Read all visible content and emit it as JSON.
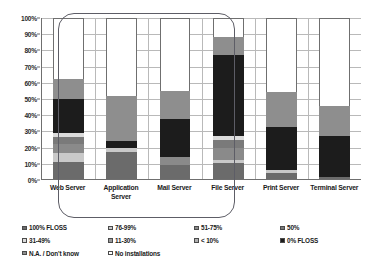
{
  "chart_data": {
    "type": "bar",
    "subtype": "stacked-100-percent",
    "title": "",
    "xlabel": "",
    "ylabel": "",
    "ylim": [
      0,
      100
    ],
    "grid": true,
    "legend_position": "bottom",
    "categories": [
      "Web Server",
      "Application Server",
      "Mail Server",
      "File Server",
      "Print Server",
      "Terminal Server"
    ],
    "y_ticks": [
      "0%",
      "10%",
      "20%",
      "30%",
      "40%",
      "50%",
      "60%",
      "70%",
      "80%",
      "90%",
      "100%"
    ],
    "series": [
      {
        "name": "100% FLOSS",
        "color": "#6b6b6b",
        "values": [
          10.5,
          17.0,
          9.0,
          10.0,
          3.5,
          1.0
        ]
      },
      {
        "name": "76-99%",
        "color": "#c9c9c9",
        "values": [
          5.5,
          2.5,
          0.0,
          2.0,
          2.0,
          0.0
        ]
      },
      {
        "name": "51-75%",
        "color": "#8a8a8a",
        "values": [
          5.5,
          0.0,
          4.5,
          7.0,
          0.0,
          0.0
        ]
      },
      {
        "name": "50%",
        "color": "#7a7a7a",
        "values": [
          4.5,
          0.0,
          0.0,
          5.0,
          0.0,
          0.0
        ]
      },
      {
        "name": "31-49%",
        "color": "#dcdcdc",
        "values": [
          2.5,
          0.0,
          0.0,
          2.5,
          0.0,
          0.0
        ]
      },
      {
        "name": "11-30%",
        "color": "#9a9a9a",
        "values": [
          0.0,
          0.0,
          0.0,
          0.0,
          0.0,
          0.0
        ]
      },
      {
        "name": "< 10%",
        "color": "#b0b0b0",
        "values": [
          0.0,
          0.0,
          0.0,
          0.0,
          0.0,
          0.0
        ]
      },
      {
        "name": "0% FLOSS",
        "color": "#1c1c1c",
        "values": [
          21.5,
          4.0,
          24.0,
          50.5,
          27.0,
          25.5
        ]
      },
      {
        "name": "N.A. / Don't know",
        "color": "#8e8e8e",
        "values": [
          12.0,
          28.0,
          17.0,
          11.5,
          21.5,
          19.0
        ]
      },
      {
        "name": "No installations",
        "color": "#ffffff",
        "values": [
          38.0,
          48.5,
          45.5,
          11.5,
          46.0,
          54.5
        ]
      }
    ],
    "annotations": [
      {
        "name": "highlight-group",
        "shape": "rounded-rectangle",
        "covers": [
          "Web Server",
          "Application Server",
          "Mail Server",
          "File Server"
        ],
        "color": "#5d5d66"
      }
    ]
  },
  "legend": {
    "items": [
      {
        "label": "100% FLOSS",
        "color": "#6b6b6b"
      },
      {
        "label": "76-99%",
        "color": "#c9c9c9"
      },
      {
        "label": "51-75%",
        "color": "#8a8a8a"
      },
      {
        "label": "50%",
        "color": "#7a7a7a"
      },
      {
        "label": "31-49%",
        "color": "#dcdcdc"
      },
      {
        "label": "11-30%",
        "color": "#9a9a9a"
      },
      {
        "label": "< 10%",
        "color": "#b0b0b0"
      },
      {
        "label": "0% FLOSS",
        "color": "#1c1c1c"
      },
      {
        "label": "N.A. / Don't know",
        "color": "#8e8e8e"
      },
      {
        "label": "No installations",
        "color": "#ffffff"
      }
    ]
  }
}
